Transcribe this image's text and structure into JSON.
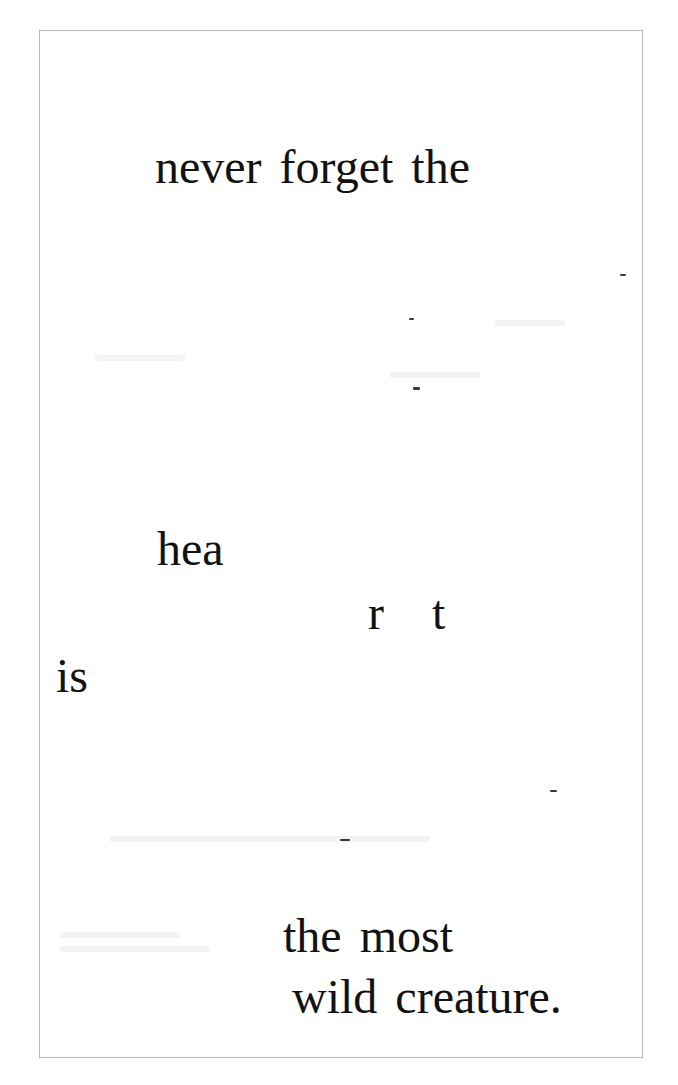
{
  "page": {
    "fragments": [
      {
        "id": "line-1",
        "text": "never forget the",
        "x": 155,
        "baseline": 187
      },
      {
        "id": "hea",
        "text": "hea",
        "x": 157,
        "baseline": 569
      },
      {
        "id": "r",
        "text": "r",
        "x": 368,
        "baseline": 633
      },
      {
        "id": "t",
        "text": "t",
        "x": 432,
        "baseline": 633
      },
      {
        "id": "is",
        "text": "is",
        "x": 56,
        "baseline": 696
      },
      {
        "id": "the-most",
        "text": "the most",
        "x": 283,
        "baseline": 956
      },
      {
        "id": "wild-creature",
        "text": "wild creature.",
        "x": 292,
        "baseline": 1017
      }
    ],
    "full_text": "never forget the heart is the most wild creature."
  }
}
